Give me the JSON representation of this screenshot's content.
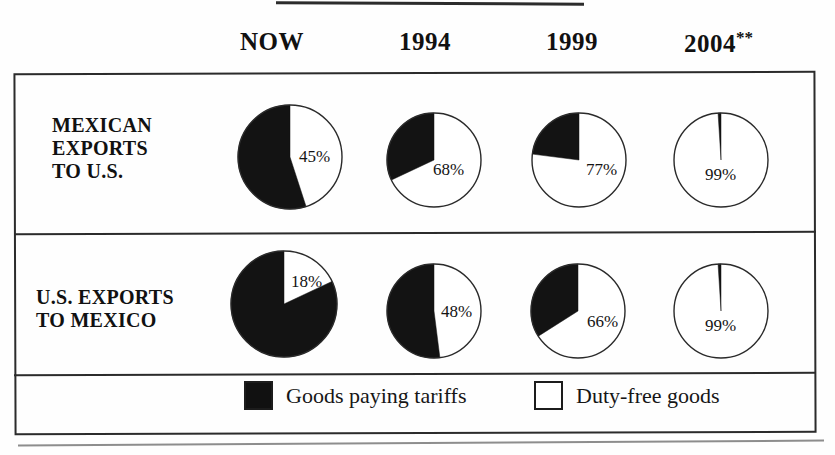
{
  "figure": {
    "columns": [
      "NOW",
      "1994",
      "1999",
      "2004"
    ],
    "column_4_superscript": "**",
    "row_labels": [
      "MEXICAN\nEXPORTS\nTO U.S.",
      "U.S. EXPORTS\nTO MEXICO"
    ],
    "legend": [
      {
        "label": "Goods paying tariffs",
        "swatch": "filled-black-square",
        "color": "#111111"
      },
      {
        "label": "Duty-free goods",
        "swatch": "hollow-white-square",
        "color": "#ffffff"
      }
    ]
  },
  "chart_data": {
    "type": "pie",
    "title": "",
    "categories": [
      "NOW",
      "1994",
      "1999",
      "2004"
    ],
    "series": [
      {
        "name": "MEXICAN EXPORTS TO U.S.",
        "values": [
          45,
          68,
          77,
          99
        ],
        "labels": [
          "45%",
          "68%",
          "77%",
          "99%"
        ]
      },
      {
        "name": "U.S. EXPORTS TO MEXICO",
        "values": [
          18,
          48,
          66,
          99
        ],
        "labels": [
          "18%",
          "48%",
          "66%",
          "99%"
        ]
      }
    ],
    "slice_meaning": {
      "white": "Duty-free goods",
      "black": "Goods paying tariffs"
    },
    "note": "Percentage label on each pie is the duty-free (white) share; remainder is black (goods paying tariffs)."
  },
  "pies": [
    {
      "row": 0,
      "col": 0,
      "pct": 45,
      "label": "45%",
      "r": 52,
      "cx": 290,
      "cy": 157,
      "label_x": 299,
      "label_y": 148
    },
    {
      "row": 0,
      "col": 1,
      "pct": 68,
      "label": "68%",
      "r": 47,
      "cx": 434,
      "cy": 160,
      "label_x": 433,
      "label_y": 161
    },
    {
      "row": 0,
      "col": 2,
      "pct": 77,
      "label": "77%",
      "r": 47,
      "cx": 579,
      "cy": 160,
      "label_x": 586,
      "label_y": 161
    },
    {
      "row": 0,
      "col": 3,
      "pct": 99,
      "label": "99%",
      "r": 47,
      "cx": 721,
      "cy": 160,
      "label_x": 705,
      "label_y": 166
    },
    {
      "row": 1,
      "col": 0,
      "pct": 18,
      "label": "18%",
      "r": 53,
      "cx": 284,
      "cy": 304,
      "label_x": 291,
      "label_y": 273
    },
    {
      "row": 1,
      "col": 1,
      "pct": 48,
      "label": "48%",
      "r": 47,
      "cx": 434,
      "cy": 311,
      "label_x": 441,
      "label_y": 303
    },
    {
      "row": 1,
      "col": 2,
      "pct": 66,
      "label": "66%",
      "r": 47,
      "cx": 578,
      "cy": 311,
      "label_x": 587,
      "label_y": 313
    },
    {
      "row": 1,
      "col": 3,
      "pct": 99,
      "label": "99%",
      "r": 47,
      "cx": 721,
      "cy": 311,
      "label_x": 705,
      "label_y": 317
    }
  ],
  "header_positions": [
    {
      "x": 240,
      "label": "NOW"
    },
    {
      "x": 399,
      "label": "1994"
    },
    {
      "x": 546,
      "label": "1999"
    },
    {
      "x": 684,
      "label": "2004"
    }
  ]
}
